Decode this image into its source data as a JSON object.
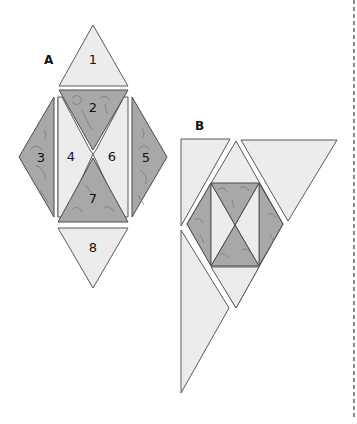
{
  "figure": {
    "colors": {
      "light_fabric": "#ececec",
      "print_fabric": "#a8a8a8",
      "outline": "#5a5a5a",
      "cut_line": "#8a8a8a"
    }
  },
  "diagram_a": {
    "label": "A",
    "pieces": [
      {
        "number": "1",
        "fabric": "light"
      },
      {
        "number": "2",
        "fabric": "print"
      },
      {
        "number": "3",
        "fabric": "print"
      },
      {
        "number": "4",
        "fabric": "light"
      },
      {
        "number": "5",
        "fabric": "print"
      },
      {
        "number": "6",
        "fabric": "light"
      },
      {
        "number": "7",
        "fabric": "print"
      },
      {
        "number": "8",
        "fabric": "light"
      }
    ]
  },
  "diagram_b": {
    "label": "B"
  }
}
